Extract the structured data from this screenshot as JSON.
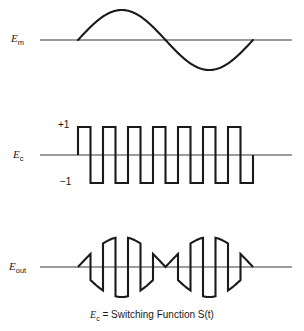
{
  "figure": {
    "background_color": "#ffffff",
    "trace_color": "#1a1a1a",
    "baseline_color": "#7a7a7a",
    "width": 304,
    "height": 331
  },
  "labels": {
    "modulating_signal": "E",
    "modulating_signal_sub": "m",
    "carrier_signal": "E",
    "carrier_signal_sub": "c",
    "output_signal": "E",
    "output_signal_sub": "out",
    "level_high": "+1",
    "level_low": "−1"
  },
  "caption": {
    "symbol": "E",
    "symbol_sub": "c",
    "text": " = Switching Function S(t)",
    "full": "Ec = Switching Function S(t)"
  },
  "chart_data": {
    "type": "line",
    "xlabel": "",
    "ylabel": "",
    "grid": false,
    "legend_position": "none",
    "panels": [
      {
        "name": "modulating-signal",
        "label": "Em",
        "waveform": "sine",
        "cycles": 1,
        "baseline_y": 40,
        "amplitude": 30,
        "x_start": 78,
        "x_end": 253,
        "line_x_start": 40,
        "line_x_end": 292,
        "description": "One full cycle of a sine wave, positive half first"
      },
      {
        "name": "carrier-signal",
        "label": "Ec",
        "waveform": "square",
        "cycles": 7,
        "baseline_y": 155,
        "amplitude": 28,
        "x_start": 78,
        "x_end": 253,
        "line_x_start": 40,
        "line_x_end": 292,
        "levels": [
          1,
          -1
        ],
        "duty_cycle": 0.5,
        "description": "Bipolar switching function alternating between +1 and -1"
      },
      {
        "name": "output-signal",
        "label": "Eout",
        "waveform": "product",
        "baseline_y": 267,
        "amplitude": 30,
        "x_start": 78,
        "x_end": 253,
        "line_x_start": 40,
        "line_x_end": 292,
        "description": "Product of the sine modulating signal and the bipolar square switching function; sine segments alternate in sign each half carrier period"
      }
    ]
  }
}
